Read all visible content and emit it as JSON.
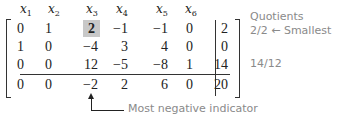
{
  "tableau": {
    "headers": [
      {
        "var": "x",
        "sub": "1"
      },
      {
        "var": "x",
        "sub": "2"
      },
      {
        "var": "x",
        "sub": "3"
      },
      {
        "var": "x",
        "sub": "4"
      },
      {
        "var": "x",
        "sub": "5"
      },
      {
        "var": "x",
        "sub": "6"
      }
    ],
    "rows": [
      {
        "cells": [
          "0",
          "1",
          "2",
          "−1",
          "−1",
          "0"
        ],
        "rhs": "2"
      },
      {
        "cells": [
          "1",
          "0",
          "−4",
          "3",
          "4",
          "0"
        ],
        "rhs": "0"
      },
      {
        "cells": [
          "0",
          "0",
          "12",
          "−5",
          "−8",
          "1"
        ],
        "rhs": "14"
      },
      {
        "cells": [
          "0",
          "0",
          "−2",
          "2",
          "6",
          "0"
        ],
        "rhs": "20"
      }
    ],
    "pivot": {
      "row": 0,
      "col": 2,
      "highlight_color": "#c8c8c8"
    }
  },
  "quotients": {
    "title": "Quotients",
    "row0": "2/2 ← Smallest",
    "row2": "14/12"
  },
  "annotation": {
    "label": "Most negative indicator",
    "arrow_icon": "arrow-up-elbow-icon"
  }
}
